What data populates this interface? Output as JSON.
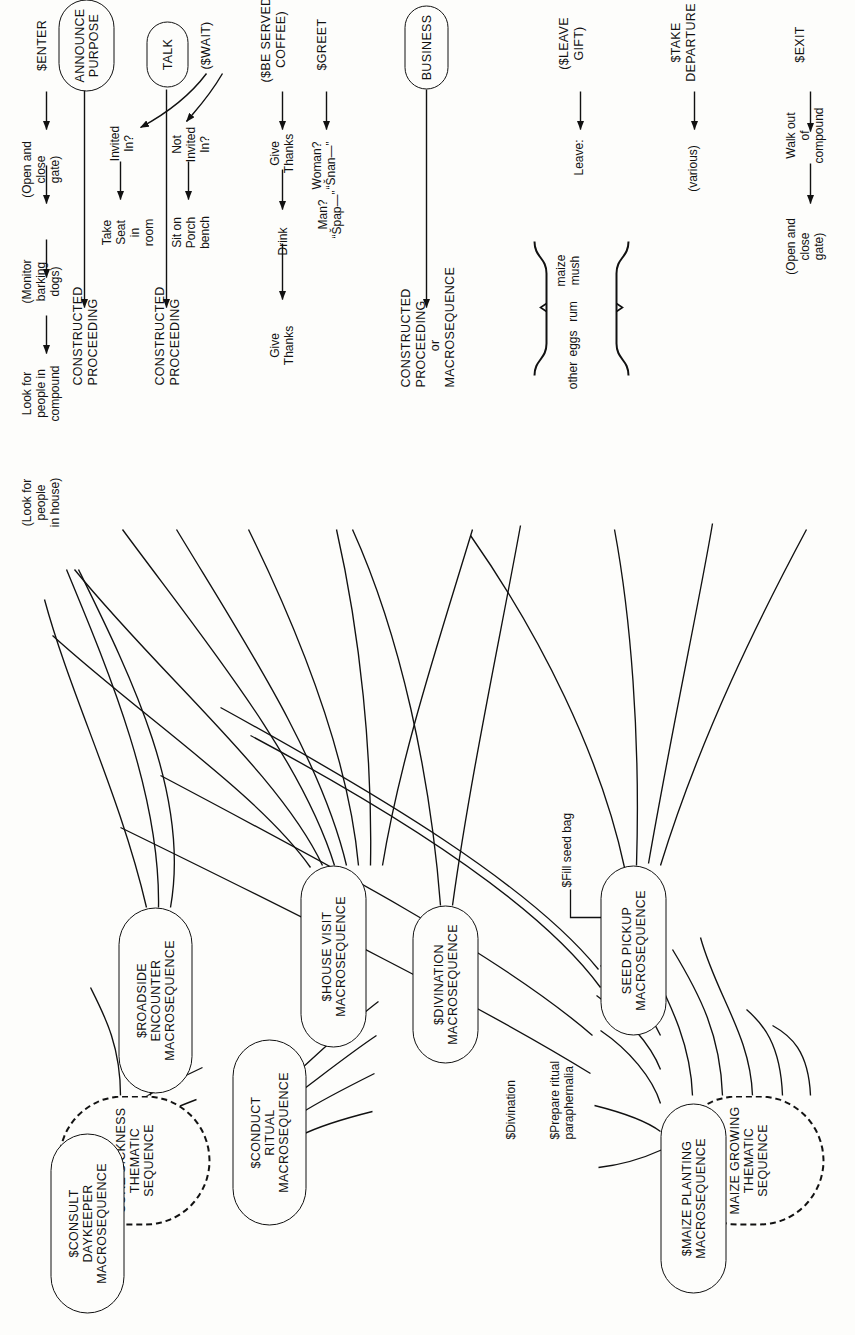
{
  "figure": {
    "type": "flow-diagram",
    "orientation": "rotated-90-ccw"
  },
  "thematic_sequences": [
    {
      "id": "maize-growing",
      "label": "MAIZE GROWING\nTHEMATIC SEQUENCE"
    },
    {
      "id": "cure-sickness",
      "label": "CURE SICKNESS\nTHEMATIC SEQUENCE"
    }
  ],
  "macrosequences": [
    {
      "id": "maize-planting",
      "label": "$MAIZE PLANTING\nMACROSEQUENCE"
    },
    {
      "id": "seed-pickup",
      "label": "SEED PICKUP\nMACROSEQUENCE"
    },
    {
      "id": "conduct-ritual",
      "label": "$CONDUCT\nRITUAL\nMACROSEQUENCE"
    },
    {
      "id": "divination",
      "label": "$DIVINATION\nMACROSEQUENCE"
    },
    {
      "id": "consult-daykeeper",
      "label": "$CONSULT\nDAYKEEPER\nMACROSEQUENCE"
    },
    {
      "id": "house-visit",
      "label": "$HOUSE VISIT\nMACROSEQUENCE"
    },
    {
      "id": "roadside-encounter",
      "label": "$ROADSIDE\nENCOUNTER\nMACROSEQUENCE"
    }
  ],
  "inline_steps": [
    {
      "id": "prepare-ritual-paraphernalia",
      "label": "$Prepare ritual\nparaphernalia"
    },
    {
      "id": "divination-step",
      "label": "$Divination"
    },
    {
      "id": "fill-seed-bag",
      "label": "$Fill seed bag"
    }
  ],
  "scene_nodes": [
    {
      "id": "business",
      "label": "BUSINESS"
    },
    {
      "id": "talk",
      "label": "TALK"
    },
    {
      "id": "announce-purpose",
      "label": "ANNOUNCE\nPURPOSE"
    }
  ],
  "rows": [
    {
      "id": "exit",
      "head": "$EXIT",
      "steps": [
        "Walk out\nof\ncompound",
        "(Open and\nclose\ngate)"
      ]
    },
    {
      "id": "take-departure",
      "head": "$TAKE\nDEPARTURE",
      "steps": [
        "(various)"
      ]
    },
    {
      "id": "leave-gift",
      "head": "($LEAVE\nGIFT)",
      "steps": [
        "Leave:"
      ],
      "brace_items": [
        "maize\nmush",
        "rum",
        "eggs",
        "other"
      ]
    },
    {
      "id": "be-served-coffee",
      "head": "($BE SERVED\nCOFFEE)",
      "steps": [
        "Give\nThanks",
        "Drink",
        "Give\nThanks"
      ]
    },
    {
      "id": "wait",
      "head": "($WAIT)",
      "branches": [
        {
          "condition": "Not\nInvited\nIn?",
          "result": "Sit on\nPorch\nbench"
        },
        {
          "condition": "Invited\nIn?",
          "result": "Take\nSeat\nin\nroom"
        }
      ]
    },
    {
      "id": "greet",
      "head": "$GREET",
      "alternatives": [
        "Woman?\n“Šnan—”",
        "Man?\n“Špap—”"
      ]
    },
    {
      "id": "enter",
      "head": "$ENTER",
      "steps": [
        "(Open and\nclose\ngate)",
        "(Monitor\nbarking\ndogs)",
        "Look for\npeople in\ncompound",
        "(Look for\npeople\nin house)"
      ]
    }
  ],
  "terminals": [
    {
      "id": "business-terminal",
      "label": "CONSTRUCTED\nPROCEEDING\nor\nMACROSEQUENCE"
    },
    {
      "id": "talk-terminal",
      "label": "CONSTRUCTED\nPROCEEDING"
    },
    {
      "id": "announce-purpose-terminal",
      "label": "CONSTRUCTED\nPROCEEDING"
    }
  ],
  "colors": {
    "ink": "#111111",
    "paper": "#fdfdfb"
  }
}
